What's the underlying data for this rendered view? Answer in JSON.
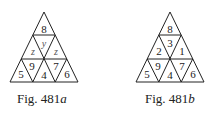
{
  "figures": [
    {
      "id": "a",
      "caption_prefix": "Fig. 481",
      "caption_suffix": "a",
      "cells": {
        "top": "8",
        "mid_left": "z",
        "mid_center": "y",
        "mid_right": "z",
        "bot_1": "5",
        "bot_2": "9",
        "bot_3": "4",
        "bot_4": "7",
        "bot_5": "6"
      }
    },
    {
      "id": "b",
      "caption_prefix": "Fig. 481",
      "caption_suffix": "b",
      "cells": {
        "top": "8",
        "mid_left": "2",
        "mid_center": "3",
        "mid_right": "1",
        "bot_1": "5",
        "bot_2": "9",
        "bot_3": "4",
        "bot_4": "7",
        "bot_5": "6"
      }
    }
  ]
}
